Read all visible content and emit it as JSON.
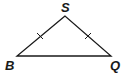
{
  "diagram": {
    "type": "isosceles-triangle",
    "vertices": [
      {
        "id": "S",
        "label": "S",
        "x": 65,
        "y": 16
      },
      {
        "id": "B",
        "label": "B",
        "x": 17,
        "y": 56
      },
      {
        "id": "Q",
        "label": "Q",
        "x": 111,
        "y": 56
      }
    ],
    "sides": [
      {
        "from": "S",
        "to": "B",
        "tick_marks": 1
      },
      {
        "from": "S",
        "to": "Q",
        "tick_marks": 1
      },
      {
        "from": "B",
        "to": "Q",
        "tick_marks": 0
      }
    ],
    "stroke_color": "#1a1a1a"
  }
}
